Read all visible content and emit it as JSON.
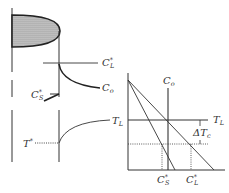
{
  "left_panel": {
    "concentration_labels": {
      "liquidus_conc": {
        "base": "C",
        "sup": "*",
        "sub": "L"
      },
      "bulk_conc": {
        "base": "C",
        "sub": "o"
      },
      "solid_conc": {
        "base": "C",
        "sup": "*",
        "sub": "S"
      }
    },
    "temperature_labels": {
      "liquidus_temp": {
        "base": "T",
        "sub": "L"
      },
      "interface_temp": {
        "base": "T",
        "sup": "*"
      }
    }
  },
  "right_panel": {
    "labels": {
      "vertical_line": {
        "base": "C",
        "sub": "o"
      },
      "horizontal_line": {
        "base": "T",
        "sub": "L"
      },
      "undercooling": {
        "base": "ΔT",
        "sub": "c"
      },
      "x_tick_solid": {
        "base": "C",
        "sup": "*",
        "sub": "S"
      },
      "x_tick_liquid": {
        "base": "C",
        "sup": "*",
        "sub": "L"
      }
    }
  },
  "colors": {
    "line": "#333333",
    "shading": "#9a9a9a",
    "background": "#ffffff"
  }
}
